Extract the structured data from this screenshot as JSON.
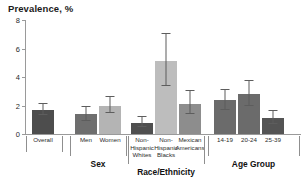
{
  "chart_data": {
    "type": "bar",
    "title": "Prevalence, %",
    "xlabel": "",
    "ylabel": "Prevalence, %",
    "ylim": [
      0,
      8
    ],
    "yticks": [
      0,
      2,
      4,
      6,
      8
    ],
    "grid": false,
    "legend": null,
    "categories": [
      "Overall",
      "Men",
      "Women",
      "Non-Hispanic Whites",
      "Non-Hispanic Blacks",
      "Mexican Americans",
      "14-19",
      "20-24",
      "25-39"
    ],
    "values": [
      1.7,
      1.4,
      2.0,
      0.8,
      5.1,
      2.1,
      2.4,
      2.8,
      1.1
    ],
    "error_low": [
      1.3,
      0.9,
      1.5,
      0.5,
      3.4,
      1.4,
      1.7,
      2.0,
      0.7
    ],
    "error_high": [
      2.1,
      1.9,
      2.6,
      1.2,
      7.0,
      3.0,
      3.1,
      3.7,
      1.6
    ],
    "bar_colors": [
      "#4d4d4d",
      "#6e6e6e",
      "#b4b4b4",
      "#4f4f4f",
      "#bdbdbd",
      "#8d8d8d",
      "#6b6b6b",
      "#6b6b6b",
      "#545454"
    ],
    "groups": [
      {
        "label": "",
        "categories": [
          "Overall"
        ]
      },
      {
        "label": "Sex",
        "categories": [
          "Men",
          "Women"
        ]
      },
      {
        "label": "Race/Ethnicity",
        "categories": [
          "Non-Hispanic Whites",
          "Non-Hispanic Blacks",
          "Mexican Americans"
        ]
      },
      {
        "label": "Age Group",
        "categories": [
          "14-19",
          "20-24",
          "25-39"
        ]
      }
    ]
  },
  "axis": {
    "tick_labels": [
      "0",
      "2",
      "4",
      "6",
      "8"
    ]
  },
  "tick_labels_display": [
    "Overall",
    "Men",
    "Women",
    "Non-\nHispanic\nWhites",
    "Non-\nHispanic\nBlacks",
    "Mexican\nAmericans",
    "14-19",
    "20-24",
    "25-39"
  ],
  "group_labels": [
    "Sex",
    "Race/Ethnicity",
    "Age Group"
  ]
}
